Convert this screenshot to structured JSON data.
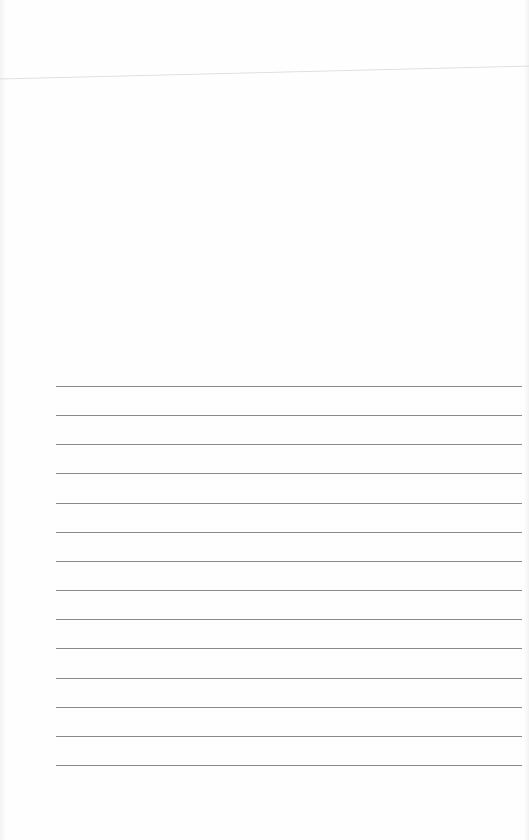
{
  "page": {
    "type": "blank-lined-sheet",
    "background_color": "#fefefe",
    "rule_color": "#8a8a8a",
    "rule_count": 14,
    "rule_start_y": 386,
    "rule_spacing": 29.15,
    "rule_left_x": 56,
    "rule_width": 466,
    "text_content": []
  }
}
